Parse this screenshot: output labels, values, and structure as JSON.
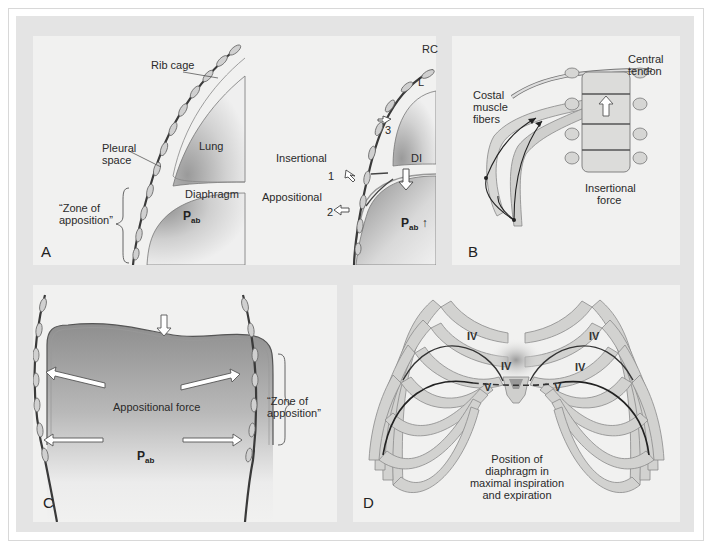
{
  "figure": {
    "colors": {
      "page": "#ffffff",
      "frame_bg": "#e4e4e4",
      "panel_bg": "#f1f1f0",
      "bone": "#d4d4d2",
      "bone_outline": "#8a8a8a",
      "diaphragm_dark": "#8d8d8d",
      "line": "#333333"
    }
  },
  "panels": {
    "A": {
      "letter": "A",
      "left": {
        "rib_cage": "Rib cage",
        "pleural_space_1": "Pleural",
        "pleural_space_2": "space",
        "lung": "Lung",
        "diaphragm": "Diaphragm",
        "zone_1": "“Zone of",
        "zone_2": "apposition”",
        "pab_main": "P",
        "pab_sub": "ab"
      },
      "right": {
        "rc": "RC",
        "l": "L",
        "num3": "3",
        "insertional": "Insertional",
        "num1": "1",
        "di": "DI",
        "appositional": "Appositional",
        "num2": "2",
        "pab_main": "P",
        "pab_sub": "ab",
        "pab_arrow": "↑"
      }
    },
    "B": {
      "letter": "B",
      "central_1": "Central",
      "central_2": "tendon",
      "costal_1": "Costal",
      "costal_2": "muscle",
      "costal_3": "fibers",
      "insertional_1": "Insertional",
      "insertional_2": "force"
    },
    "C": {
      "letter": "C",
      "appositional_force": "Appositional force",
      "pab_main": "P",
      "pab_sub": "ab",
      "zone_1": "“Zone of",
      "zone_2": "apposition”"
    },
    "D": {
      "letter": "D",
      "rib_labels": [
        "IV",
        "IV",
        "IV",
        "IV",
        "V",
        "V"
      ],
      "caption_1": "Position of",
      "caption_2": "diaphragm in",
      "caption_3": "maximal inspiration",
      "caption_4": "and expiration"
    }
  }
}
